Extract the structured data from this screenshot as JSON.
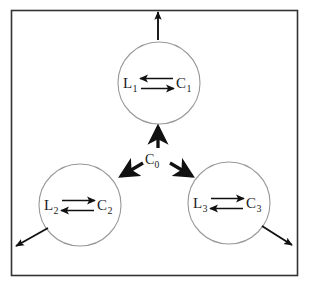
{
  "figure": {
    "type": "node-link diagram",
    "background_color": "#ffffff",
    "frame_color": "#333333",
    "circle_stroke_color": "#999999",
    "arrow_color": "#111111",
    "text_color": "#1a1a1a"
  },
  "hub": {
    "id": "C0",
    "base": "C",
    "subscript": "0",
    "x": 152,
    "y": 160
  },
  "clusters": [
    {
      "id": "cluster-1",
      "cx": 159,
      "cy": 83,
      "r": 41,
      "left_node": {
        "base": "L",
        "subscript": "1"
      },
      "right_node": {
        "base": "C",
        "subscript": "1"
      },
      "top_arrow_direction": "left",
      "bottom_arrow_direction": "right",
      "exit_arrow_direction": "up"
    },
    {
      "id": "cluster-2",
      "cx": 80,
      "cy": 205,
      "r": 41,
      "left_node": {
        "base": "L",
        "subscript": "2"
      },
      "right_node": {
        "base": "C",
        "subscript": "2"
      },
      "top_arrow_direction": "right",
      "bottom_arrow_direction": "left",
      "exit_arrow_direction": "down-left"
    },
    {
      "id": "cluster-3",
      "cx": 229,
      "cy": 203,
      "r": 41,
      "left_node": {
        "base": "L",
        "subscript": "3"
      },
      "right_node": {
        "base": "C",
        "subscript": "3"
      },
      "top_arrow_direction": "right",
      "bottom_arrow_direction": "left",
      "exit_arrow_direction": "down-right"
    }
  ],
  "hub_arrows": [
    {
      "name": "hub-arrow-up",
      "target": "cluster-1"
    },
    {
      "name": "hub-arrow-down-left",
      "target": "cluster-2"
    },
    {
      "name": "hub-arrow-down-right",
      "target": "cluster-3"
    }
  ]
}
